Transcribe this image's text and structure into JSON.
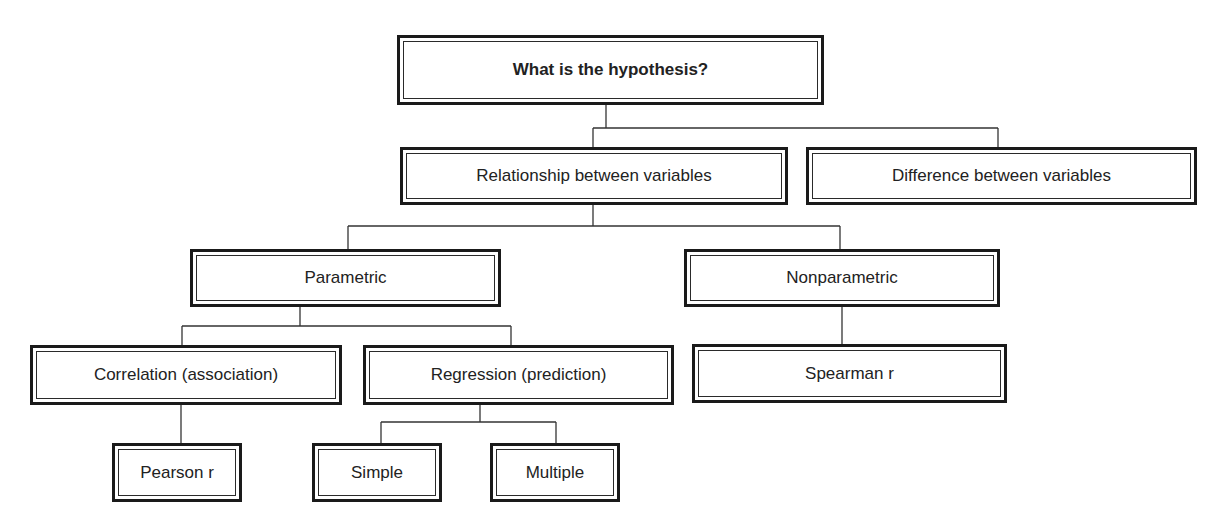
{
  "diagram": {
    "type": "decision-tree",
    "nodes": {
      "root": {
        "label": "What is the hypothesis?"
      },
      "relationship": {
        "label": "Relationship between variables"
      },
      "difference": {
        "label": "Difference between variables"
      },
      "parametric": {
        "label": "Parametric"
      },
      "nonparametric": {
        "label": "Nonparametric"
      },
      "correlation": {
        "label": "Correlation (association)"
      },
      "regression": {
        "label": "Regression (prediction)"
      },
      "spearman": {
        "label": "Spearman r"
      },
      "pearson": {
        "label": "Pearson r"
      },
      "simple": {
        "label": "Simple"
      },
      "multiple": {
        "label": "Multiple"
      }
    },
    "edges": [
      [
        "root",
        "relationship"
      ],
      [
        "root",
        "difference"
      ],
      [
        "relationship",
        "parametric"
      ],
      [
        "relationship",
        "nonparametric"
      ],
      [
        "parametric",
        "correlation"
      ],
      [
        "parametric",
        "regression"
      ],
      [
        "nonparametric",
        "spearman"
      ],
      [
        "correlation",
        "pearson"
      ],
      [
        "regression",
        "simple"
      ],
      [
        "regression",
        "multiple"
      ]
    ]
  }
}
